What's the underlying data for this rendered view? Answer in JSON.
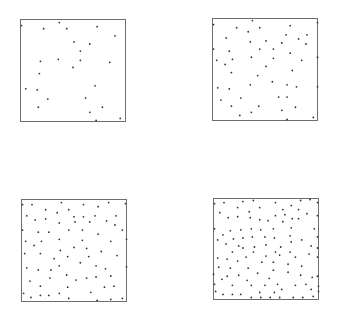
{
  "chart_data": [
    {
      "type": "scatter",
      "title": "",
      "xlabel": "",
      "ylabel": "",
      "xlim": [
        0,
        1
      ],
      "ylim": [
        0,
        1
      ],
      "grid": false,
      "legend": null,
      "n_points": 25,
      "points": [
        [
          0.01,
          0.94
        ],
        [
          0.37,
          0.97
        ],
        [
          0.22,
          0.91
        ],
        [
          0.44,
          0.91
        ],
        [
          0.73,
          0.93
        ],
        [
          0.9,
          0.84
        ],
        [
          0.51,
          0.78
        ],
        [
          0.66,
          0.76
        ],
        [
          0.57,
          0.69
        ],
        [
          0.19,
          0.59
        ],
        [
          0.36,
          0.61
        ],
        [
          0.57,
          0.6
        ],
        [
          0.85,
          0.58
        ],
        [
          0.5,
          0.53
        ],
        [
          0.18,
          0.47
        ],
        [
          0.05,
          0.32
        ],
        [
          0.16,
          0.31
        ],
        [
          0.71,
          0.35
        ],
        [
          0.26,
          0.22
        ],
        [
          0.62,
          0.23
        ],
        [
          0.17,
          0.14
        ],
        [
          0.78,
          0.14
        ],
        [
          0.66,
          0.09
        ],
        [
          0.72,
          0.01
        ],
        [
          0.95,
          0.03
        ]
      ]
    },
    {
      "type": "scatter",
      "title": "",
      "xlabel": "",
      "ylabel": "",
      "xlim": [
        0,
        1
      ],
      "ylim": [
        0,
        1
      ],
      "grid": false,
      "legend": null,
      "n_points": 50,
      "points": [
        [
          0.01,
          0.94
        ],
        [
          0.38,
          0.98
        ],
        [
          0.23,
          0.91
        ],
        [
          0.34,
          0.87
        ],
        [
          0.45,
          0.91
        ],
        [
          0.74,
          0.93
        ],
        [
          1.0,
          0.96
        ],
        [
          0.7,
          0.84
        ],
        [
          0.9,
          0.84
        ],
        [
          0.13,
          0.81
        ],
        [
          0.36,
          0.77
        ],
        [
          0.51,
          0.78
        ],
        [
          0.66,
          0.76
        ],
        [
          0.82,
          0.8
        ],
        [
          0.89,
          0.75
        ],
        [
          0.01,
          0.7
        ],
        [
          0.45,
          0.7
        ],
        [
          0.58,
          0.7
        ],
        [
          0.16,
          0.68
        ],
        [
          0.74,
          0.66
        ],
        [
          0.04,
          0.59
        ],
        [
          0.19,
          0.6
        ],
        [
          0.37,
          0.62
        ],
        [
          0.58,
          0.61
        ],
        [
          0.85,
          0.59
        ],
        [
          1.0,
          0.62
        ],
        [
          0.12,
          0.55
        ],
        [
          0.51,
          0.53
        ],
        [
          0.18,
          0.47
        ],
        [
          0.76,
          0.49
        ],
        [
          0.43,
          0.44
        ],
        [
          0.57,
          0.38
        ],
        [
          0.36,
          0.35
        ],
        [
          0.71,
          0.35
        ],
        [
          0.05,
          0.32
        ],
        [
          0.16,
          0.31
        ],
        [
          0.8,
          0.33
        ],
        [
          1.0,
          0.33
        ],
        [
          0.63,
          0.23
        ],
        [
          0.71,
          0.23
        ],
        [
          0.27,
          0.22
        ],
        [
          0.08,
          0.2
        ],
        [
          0.18,
          0.14
        ],
        [
          0.44,
          0.14
        ],
        [
          0.79,
          0.13
        ],
        [
          0.66,
          0.1
        ],
        [
          0.37,
          0.08
        ],
        [
          0.26,
          0.05
        ],
        [
          0.71,
          0.01
        ],
        [
          0.96,
          0.03
        ]
      ]
    },
    {
      "type": "scatter",
      "title": "",
      "xlabel": "",
      "ylabel": "",
      "xlim": [
        0,
        1
      ],
      "ylim": [
        0,
        1
      ],
      "grid": false,
      "legend": null,
      "n_points": 75,
      "points": [
        [
          0.01,
          0.95
        ],
        [
          0.1,
          0.95
        ],
        [
          0.38,
          0.97
        ],
        [
          0.59,
          0.95
        ],
        [
          0.83,
          0.97
        ],
        [
          0.99,
          0.96
        ],
        [
          0.23,
          0.9
        ],
        [
          0.34,
          0.87
        ],
        [
          0.45,
          0.9
        ],
        [
          0.73,
          0.93
        ],
        [
          0.05,
          0.84
        ],
        [
          0.13,
          0.8
        ],
        [
          0.23,
          0.81
        ],
        [
          0.5,
          0.83
        ],
        [
          0.59,
          0.83
        ],
        [
          0.7,
          0.84
        ],
        [
          0.9,
          0.84
        ],
        [
          0.81,
          0.79
        ],
        [
          0.36,
          0.77
        ],
        [
          0.51,
          0.78
        ],
        [
          0.65,
          0.78
        ],
        [
          0.89,
          0.75
        ],
        [
          0.01,
          0.7
        ],
        [
          0.16,
          0.68
        ],
        [
          0.26,
          0.68
        ],
        [
          0.45,
          0.7
        ],
        [
          0.58,
          0.7
        ],
        [
          0.96,
          0.7
        ],
        [
          0.73,
          0.66
        ],
        [
          0.36,
          0.61
        ],
        [
          0.58,
          0.6
        ],
        [
          0.04,
          0.59
        ],
        [
          0.19,
          0.59
        ],
        [
          0.85,
          0.59
        ],
        [
          1.0,
          0.61
        ],
        [
          0.12,
          0.55
        ],
        [
          0.5,
          0.53
        ],
        [
          0.62,
          0.52
        ],
        [
          0.37,
          0.5
        ],
        [
          0.76,
          0.49
        ],
        [
          0.03,
          0.47
        ],
        [
          0.18,
          0.47
        ],
        [
          0.44,
          0.44
        ],
        [
          0.64,
          0.44
        ],
        [
          0.91,
          0.45
        ],
        [
          0.31,
          0.42
        ],
        [
          0.56,
          0.38
        ],
        [
          0.36,
          0.35
        ],
        [
          0.71,
          0.35
        ],
        [
          0.05,
          0.33
        ],
        [
          0.16,
          0.31
        ],
        [
          0.28,
          0.31
        ],
        [
          0.8,
          0.32
        ],
        [
          1.0,
          0.34
        ],
        [
          0.43,
          0.26
        ],
        [
          0.27,
          0.23
        ],
        [
          0.52,
          0.21
        ],
        [
          0.62,
          0.23
        ],
        [
          0.71,
          0.24
        ],
        [
          0.85,
          0.25
        ],
        [
          0.08,
          0.2
        ],
        [
          0.88,
          0.15
        ],
        [
          0.18,
          0.15
        ],
        [
          0.44,
          0.14
        ],
        [
          0.79,
          0.14
        ],
        [
          0.66,
          0.09
        ],
        [
          0.02,
          0.08
        ],
        [
          0.36,
          0.08
        ],
        [
          0.09,
          0.04
        ],
        [
          0.18,
          0.06
        ],
        [
          0.26,
          0.06
        ],
        [
          0.45,
          0.03
        ],
        [
          0.72,
          0.01
        ],
        [
          0.85,
          0.02
        ],
        [
          0.96,
          0.03
        ]
      ]
    },
    {
      "type": "scatter",
      "title": "",
      "xlabel": "",
      "ylabel": "",
      "xlim": [
        0,
        1
      ],
      "ylim": [
        0,
        1
      ],
      "grid": false,
      "legend": null,
      "n_points": 110,
      "points": [
        [
          0.01,
          0.95
        ],
        [
          0.1,
          0.96
        ],
        [
          0.28,
          0.97
        ],
        [
          0.38,
          0.98
        ],
        [
          0.59,
          0.96
        ],
        [
          0.74,
          0.93
        ],
        [
          0.83,
          0.98
        ],
        [
          0.92,
          0.99
        ],
        [
          0.99,
          0.96
        ],
        [
          0.23,
          0.91
        ],
        [
          0.34,
          0.87
        ],
        [
          0.44,
          0.91
        ],
        [
          0.81,
          0.89
        ],
        [
          0.66,
          0.89
        ],
        [
          0.06,
          0.86
        ],
        [
          0.14,
          0.81
        ],
        [
          0.23,
          0.82
        ],
        [
          0.35,
          0.81
        ],
        [
          0.44,
          0.79
        ],
        [
          0.52,
          0.78
        ],
        [
          0.59,
          0.83
        ],
        [
          0.68,
          0.84
        ],
        [
          0.75,
          0.8
        ],
        [
          0.89,
          0.85
        ],
        [
          0.99,
          0.83
        ],
        [
          0.81,
          0.8
        ],
        [
          0.66,
          0.77
        ],
        [
          0.01,
          0.7
        ],
        [
          0.16,
          0.68
        ],
        [
          0.26,
          0.69
        ],
        [
          0.36,
          0.7
        ],
        [
          0.45,
          0.69
        ],
        [
          0.57,
          0.7
        ],
        [
          0.74,
          0.71
        ],
        [
          0.96,
          0.7
        ],
        [
          0.09,
          0.64
        ],
        [
          0.19,
          0.6
        ],
        [
          0.28,
          0.61
        ],
        [
          0.37,
          0.62
        ],
        [
          0.49,
          0.62
        ],
        [
          0.58,
          0.61
        ],
        [
          0.73,
          0.63
        ],
        [
          0.84,
          0.59
        ],
        [
          0.99,
          0.62
        ],
        [
          0.04,
          0.59
        ],
        [
          0.12,
          0.55
        ],
        [
          0.24,
          0.53
        ],
        [
          0.39,
          0.52
        ],
        [
          0.5,
          0.54
        ],
        [
          0.64,
          0.52
        ],
        [
          0.74,
          0.57
        ],
        [
          0.93,
          0.53
        ],
        [
          0.18,
          0.47
        ],
        [
          0.28,
          0.51
        ],
        [
          0.38,
          0.47
        ],
        [
          0.59,
          0.47
        ],
        [
          0.73,
          0.47
        ],
        [
          0.91,
          0.45
        ],
        [
          0.99,
          0.51
        ],
        [
          0.04,
          0.41
        ],
        [
          0.13,
          0.4
        ],
        [
          0.31,
          0.42
        ],
        [
          0.5,
          0.43
        ],
        [
          0.63,
          0.44
        ],
        [
          0.78,
          0.42
        ],
        [
          0.05,
          0.32
        ],
        [
          0.16,
          0.31
        ],
        [
          0.23,
          0.38
        ],
        [
          0.33,
          0.31
        ],
        [
          0.46,
          0.37
        ],
        [
          0.57,
          0.37
        ],
        [
          0.71,
          0.35
        ],
        [
          0.84,
          0.33
        ],
        [
          0.99,
          0.42
        ],
        [
          0.57,
          0.29
        ],
        [
          0.71,
          0.27
        ],
        [
          0.42,
          0.26
        ],
        [
          0.24,
          0.24
        ],
        [
          0.13,
          0.23
        ],
        [
          0.0,
          0.25
        ],
        [
          0.53,
          0.21
        ],
        [
          0.32,
          0.19
        ],
        [
          0.83,
          0.24
        ],
        [
          0.94,
          0.22
        ],
        [
          0.08,
          0.2
        ],
        [
          0.99,
          0.23
        ],
        [
          0.01,
          0.15
        ],
        [
          0.18,
          0.14
        ],
        [
          0.36,
          0.14
        ],
        [
          0.49,
          0.14
        ],
        [
          0.61,
          0.15
        ],
        [
          0.78,
          0.14
        ],
        [
          0.88,
          0.15
        ],
        [
          1.0,
          0.13
        ],
        [
          0.02,
          0.08
        ],
        [
          0.09,
          0.05
        ],
        [
          0.18,
          0.05
        ],
        [
          0.26,
          0.05
        ],
        [
          0.44,
          0.07
        ],
        [
          0.58,
          0.07
        ],
        [
          0.65,
          0.1
        ],
        [
          0.93,
          0.1
        ],
        [
          1.0,
          0.08
        ],
        [
          0.36,
          0.02
        ],
        [
          0.45,
          0.02
        ],
        [
          0.54,
          0.02
        ],
        [
          0.63,
          0.02
        ],
        [
          0.76,
          0.02
        ],
        [
          0.85,
          0.02
        ],
        [
          0.95,
          0.03
        ]
      ]
    }
  ],
  "colors": {
    "frame": "#6e6e6e",
    "point": "#333333",
    "background": "#ffffff"
  }
}
